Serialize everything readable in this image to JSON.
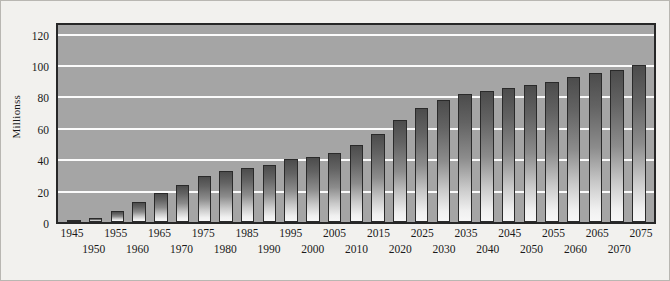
{
  "chart_data": {
    "type": "bar",
    "title": "",
    "xlabel": "",
    "ylabel": "Millionss",
    "ylim": [
      0,
      128
    ],
    "yticks": [
      0,
      20,
      40,
      60,
      80,
      100,
      120
    ],
    "ytick_labels": [
      "0",
      "20",
      "40",
      "60",
      "80",
      "100",
      "120"
    ],
    "grid": true,
    "legend": false,
    "categories": [
      "1945",
      "1950",
      "1955",
      "1960",
      "1965",
      "1970",
      "1975",
      "1980",
      "1985",
      "1990",
      "1995",
      "2000",
      "2005",
      "2010",
      "2015",
      "2020",
      "2025",
      "2030",
      "2035",
      "2040",
      "2045",
      "2050",
      "2055",
      "2060",
      "2065",
      "2070",
      "2075"
    ],
    "values": [
      1,
      2.5,
      7,
      13,
      19,
      24,
      30,
      33,
      35,
      37,
      41,
      42,
      45,
      50,
      57,
      66,
      74,
      79,
      83,
      85,
      87,
      89,
      91,
      94,
      97,
      99,
      102
    ],
    "colors": {
      "figure_background": "#f2f1ee",
      "plot_background": "#a5a5a5",
      "gridline": "#fbfbfb",
      "bar_top": "#4c4c4c",
      "bar_bottom": "#f7f7f7",
      "bar_outline": "#2a2a2a",
      "axis_frame": "#272727",
      "text": "#1a1a1a"
    }
  }
}
